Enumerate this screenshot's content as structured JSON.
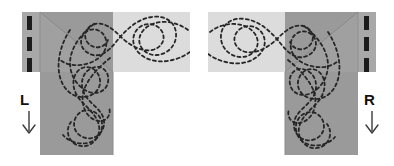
{
  "figure": {
    "type": "diagram",
    "background_color": "#ffffff",
    "panel_count": 2
  },
  "colors": {
    "road_dark": "#9a9a9a",
    "road_light": "#dcdcdc",
    "road_mid": "#b5b5b5",
    "lane_marking": "#1c1c1c",
    "trajectory": "#262626",
    "label_text": "#111111",
    "arrow": "#3a3a3a",
    "edge_line": "#8e8e8e"
  },
  "panels": [
    {
      "id": "left",
      "label": "L",
      "label_name": "left-turn-label",
      "arrow_direction": "down",
      "arrow_name": "left-approach-arrow",
      "approach_side": "left",
      "horizontal_band": {
        "fill": "#dcdcdc",
        "x": 22,
        "y": 12,
        "width": 168,
        "height": 60
      },
      "vertical_leg": {
        "fill": "#9a9a9a",
        "x": 40,
        "y": 12,
        "width": 73,
        "height": 143
      },
      "lane_marking_strip": {
        "x": 22,
        "y": 12,
        "width": 18,
        "height": 60,
        "dash_count": 3,
        "dash_color": "#1c1c1c"
      },
      "trajectory_count": 2
    },
    {
      "id": "right",
      "label": "R",
      "label_name": "right-turn-label",
      "arrow_direction": "down",
      "arrow_name": "right-approach-arrow",
      "approach_side": "right",
      "horizontal_band": {
        "fill": "#dcdcdc",
        "x": 11,
        "y": 12,
        "width": 168,
        "height": 60
      },
      "vertical_leg": {
        "fill": "#9a9a9a",
        "x": 88,
        "y": 12,
        "width": 73,
        "height": 143
      },
      "lane_marking_strip": {
        "x": 161,
        "y": 12,
        "width": 18,
        "height": 60,
        "dash_count": 3,
        "dash_color": "#1c1c1c"
      },
      "trajectory_count": 2
    }
  ],
  "lane_dashes": [
    {
      "y": 16,
      "height": 14
    },
    {
      "y": 37,
      "height": 14
    },
    {
      "y": 58,
      "height": 14
    }
  ],
  "trajectory_style": {
    "stroke_width": 1.8,
    "dash_pattern": "3 3",
    "linecap": "round"
  }
}
